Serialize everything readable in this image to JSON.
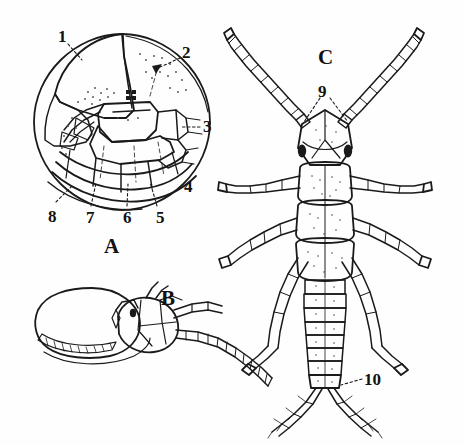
{
  "plate": {
    "width": 465,
    "height": 445,
    "background_color": "#fefefe",
    "ink_color": "#1a1a1a",
    "style": "black-and-white line drawing, scientific illustration plate"
  },
  "figures": [
    {
      "key": "A",
      "label": "A",
      "caption_position": {
        "x": 104,
        "y": 236
      },
      "description": "circular dorsal view of a rounded segmented body (curled arthropod), showing head plate, thoracic segments and abdominal segments",
      "center": {
        "x": 122,
        "y": 122
      },
      "radius": 88
    },
    {
      "key": "B",
      "label": "B",
      "caption_position": {
        "x": 161,
        "y": 288
      },
      "description": "lateral view of head with large rounded body mass and long segmented antenna extending to the right",
      "center": {
        "x": 120,
        "y": 335
      }
    },
    {
      "key": "C",
      "label": "C",
      "caption_position": {
        "x": 318,
        "y": 47
      },
      "description": "dorsal view of an insect nymph with long segmented antennae, three thoracic segments, six legs, segmented abdomen and two terminal cerci",
      "center": {
        "x": 325,
        "y": 230
      }
    }
  ],
  "callouts": [
    {
      "id": "1",
      "text": "1",
      "figure": "A",
      "x": 58,
      "y": 28,
      "leader": {
        "x1": 68,
        "y1": 44,
        "x2": 82,
        "y2": 60
      }
    },
    {
      "id": "2",
      "text": "2",
      "figure": "A",
      "x": 182,
      "y": 44,
      "leader": {
        "x1": 180,
        "y1": 58,
        "x2": 158,
        "y2": 68
      }
    },
    {
      "id": "3",
      "text": "3",
      "figure": "A",
      "x": 203,
      "y": 118,
      "leader": {
        "x1": 200,
        "y1": 127,
        "x2": 182,
        "y2": 127
      }
    },
    {
      "id": "4",
      "text": "4",
      "figure": "A",
      "x": 184,
      "y": 178,
      "leader": null
    },
    {
      "id": "5",
      "text": "5",
      "figure": "A",
      "x": 156,
      "y": 209,
      "leader": {
        "x1": 157,
        "y1": 206,
        "x2": 150,
        "y2": 182
      }
    },
    {
      "id": "6",
      "text": "6",
      "figure": "A",
      "x": 123,
      "y": 209,
      "leader": {
        "x1": 127,
        "y1": 206,
        "x2": 128,
        "y2": 184
      }
    },
    {
      "id": "7",
      "text": "7",
      "figure": "A",
      "x": 86,
      "y": 209,
      "leader": {
        "x1": 91,
        "y1": 206,
        "x2": 96,
        "y2": 183
      }
    },
    {
      "id": "8",
      "text": "8",
      "figure": "A",
      "x": 48,
      "y": 208,
      "leader": {
        "x1": 56,
        "y1": 202,
        "x2": 72,
        "y2": 186
      }
    },
    {
      "id": "9",
      "text": "9",
      "figure": "C",
      "x": 318,
      "y": 83,
      "leader_left": {
        "x1": 320,
        "y1": 98,
        "x2": 304,
        "y2": 122
      },
      "leader_right": {
        "x1": 330,
        "y1": 98,
        "x2": 348,
        "y2": 122
      }
    },
    {
      "id": "10",
      "text": "10",
      "figure": "C",
      "x": 364,
      "y": 371,
      "leader": {
        "x1": 362,
        "y1": 379,
        "x2": 341,
        "y2": 385
      }
    }
  ],
  "figure_captions": {
    "a": "A",
    "b": "B",
    "c": "C"
  }
}
